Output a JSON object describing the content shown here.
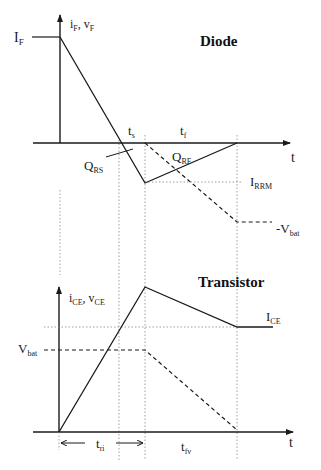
{
  "diode": {
    "title": "Diode",
    "y_axis_label_main": "i",
    "y_axis_label_sub1": "F",
    "y_axis_label_sep": ", v",
    "y_axis_label_sub2": "F",
    "x_axis_label": "t",
    "level_if_main": "I",
    "level_if_sub": "F",
    "ts_main": "t",
    "ts_sub": "s",
    "tf_main": "t",
    "tf_sub": "f",
    "qrs_main": "Q",
    "qrs_sub": "RS",
    "qrf_main": "Q",
    "qrf_sub": "RF",
    "irrm_main": "I",
    "irrm_sub": "RRM",
    "vbat_main": "-V",
    "vbat_sub": "bat"
  },
  "transistor": {
    "title": "Transistor",
    "y_axis_label_main": "i",
    "y_axis_label_sub1": "CE",
    "y_axis_label_sep": ", v",
    "y_axis_label_sub2": "CE",
    "x_axis_label": "t",
    "ice_main": "I",
    "ice_sub": "CE",
    "vbat_main": "V",
    "vbat_sub": "bat",
    "tri_main": "t",
    "tri_sub": "ri",
    "tfv_main": "t",
    "tfv_sub": "fv"
  },
  "colors": {
    "line": "#1a1a1a",
    "guide": "#777777",
    "background": "#ffffff"
  }
}
